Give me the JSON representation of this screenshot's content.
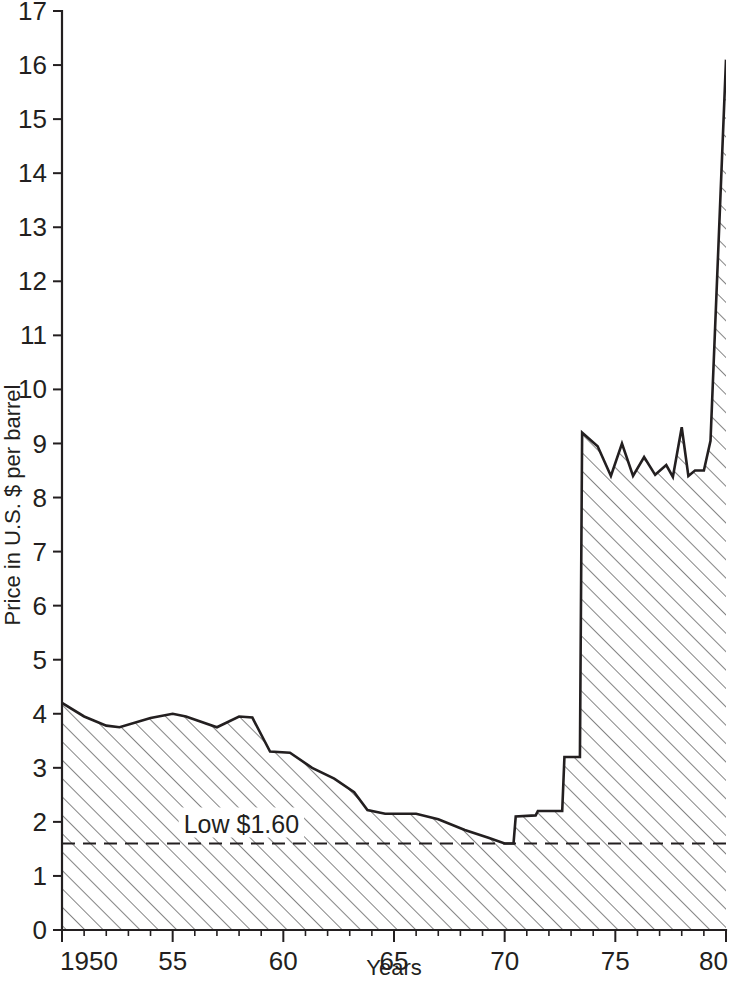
{
  "chart_data": {
    "type": "area",
    "title": "",
    "xlabel": "Years",
    "ylabel": "Price in U.S. $ per barrel",
    "xlim": [
      1950,
      1980
    ],
    "ylim": [
      0,
      17
    ],
    "grid": false,
    "legend": "none",
    "fill_style": "diagonal-hatch",
    "x_tick_labels": [
      "1950",
      "55",
      "60",
      "65",
      "70",
      "75",
      "80"
    ],
    "x_tick_values": [
      1950,
      1955,
      1960,
      1965,
      1970,
      1975,
      1980
    ],
    "y_tick_labels": [
      "0",
      "1",
      "2",
      "3",
      "4",
      "5",
      "6",
      "7",
      "8",
      "9",
      "10",
      "11",
      "12",
      "13",
      "14",
      "15",
      "16",
      "17"
    ],
    "y_tick_values": [
      0,
      1,
      2,
      3,
      4,
      5,
      6,
      7,
      8,
      9,
      10,
      11,
      12,
      13,
      14,
      15,
      16,
      17
    ],
    "series": [
      {
        "name": "Price in U.S. $ per barrel",
        "x": [
          1950.0,
          1951.0,
          1952.0,
          1952.6,
          1954.0,
          1955.0,
          1955.6,
          1957.0,
          1958.0,
          1958.6,
          1959.4,
          1960.3,
          1961.3,
          1962.3,
          1963.2,
          1963.8,
          1964.6,
          1966.0,
          1967.0,
          1968.2,
          1969.3,
          1970.0,
          1970.4,
          1970.5,
          1971.4,
          1971.5,
          1972.6,
          1972.7,
          1973.4,
          1973.5,
          1974.2,
          1974.8,
          1975.3,
          1975.8,
          1976.3,
          1976.8,
          1977.3,
          1977.6,
          1978.0,
          1978.3,
          1978.6,
          1979.0,
          1979.3,
          1980.0
        ],
        "y": [
          4.2,
          3.95,
          3.78,
          3.75,
          3.92,
          4.0,
          3.95,
          3.75,
          3.95,
          3.93,
          3.3,
          3.28,
          3.0,
          2.8,
          2.55,
          2.22,
          2.15,
          2.15,
          2.05,
          1.85,
          1.7,
          1.6,
          1.6,
          2.1,
          2.12,
          2.2,
          2.2,
          3.2,
          3.2,
          9.2,
          8.95,
          8.4,
          9.0,
          8.4,
          8.75,
          8.42,
          8.6,
          8.38,
          9.3,
          8.4,
          8.5,
          8.5,
          9.05,
          16.1
        ]
      }
    ],
    "annotations": [
      {
        "name": "low-reference",
        "text": "Low $1.60",
        "value": 1.6,
        "style": "dashed-horizontal-line",
        "label_x": 1955.5
      }
    ]
  },
  "axes": {
    "y_axis_title": "Price in U.S. $ per barrel",
    "x_axis_title": "Years"
  }
}
